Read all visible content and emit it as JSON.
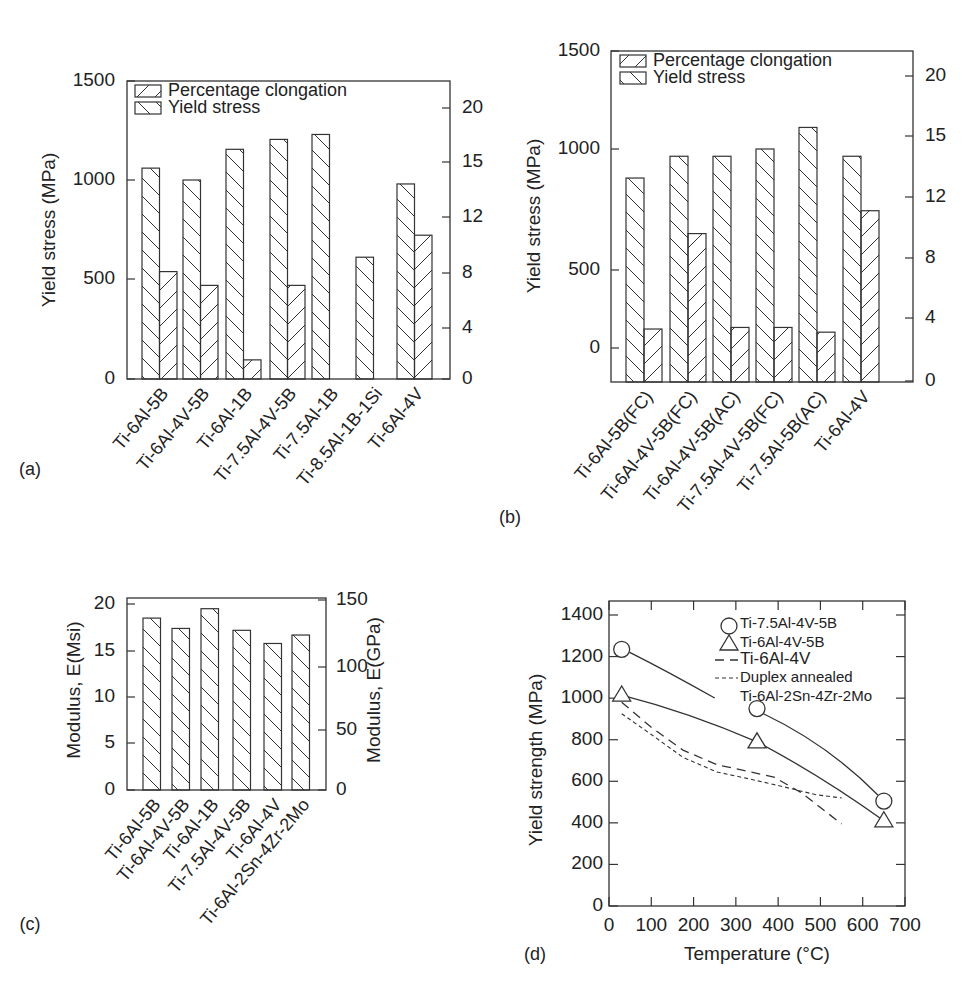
{
  "figure": {
    "panels": [
      "(a)",
      "(b)",
      "(c)",
      "(d)"
    ]
  },
  "chart_data": [
    {
      "id": "a",
      "panel_label": "(a)",
      "type": "bar",
      "title": "",
      "xlabel": "",
      "ylabel": "Yield stress (MPa)",
      "y2label": "",
      "ylim": [
        0,
        1500
      ],
      "yticks": [
        0,
        500,
        1000,
        1500
      ],
      "y2ticks": [
        "0",
        "4",
        "8",
        "12",
        "15",
        "20"
      ],
      "y2lim": [
        0,
        20
      ],
      "grid": false,
      "legend": [
        "Percentage clongation",
        "Yield stress"
      ],
      "legend_position": "upper left",
      "categories": [
        "Ti-6Al-5B",
        "Ti-6Al-4V-5B",
        "Ti-6Al-1B",
        "Ti-7.5Al-4V-5B",
        "Ti-7.5Al-1B",
        "Ti-8.5Al-1B-1Si",
        "Ti-6Al-4V"
      ],
      "series": [
        {
          "name": "Yield stress",
          "axis": "left",
          "pattern": "backslash",
          "values": [
            1060,
            1000,
            1155,
            1205,
            1230,
            610,
            980
          ]
        },
        {
          "name": "Percentage clongation",
          "axis": "right",
          "pattern": "slash",
          "values": [
            8.1,
            7.1,
            1.5,
            7.1,
            null,
            null,
            10.7
          ]
        }
      ]
    },
    {
      "id": "b",
      "panel_label": "(b)",
      "type": "bar",
      "title": "",
      "xlabel": "",
      "ylabel": "Yield stress (MPa)",
      "y2label": "",
      "ylim": [
        0,
        1500
      ],
      "yticks": [
        0,
        500,
        1000,
        1500
      ],
      "y2ticks": [
        "0",
        "4",
        "8",
        "12",
        "15",
        "20"
      ],
      "y2lim": [
        0,
        20
      ],
      "grid": false,
      "legend": [
        "Percentage clongation",
        "Yield stress"
      ],
      "legend_position": "upper left",
      "categories": [
        "Ti-6Al-5B(FC)",
        "Ti-6Al-4V-5B(FC)",
        "Ti-6Al-4V-5B(AC)",
        "Ti-7.5Al-4V-5B(FC)",
        "Ti-7.5Al-5B(AC)",
        "Ti-6Al-4V"
      ],
      "series": [
        {
          "name": "Yield stress",
          "axis": "left",
          "pattern": "backslash",
          "values": [
            880,
            970,
            970,
            1000,
            1110,
            970
          ]
        },
        {
          "name": "Percentage clongation",
          "axis": "right",
          "pattern": "slash",
          "values": [
            3.3,
            9.6,
            3.4,
            3.4,
            3.1,
            11.1
          ]
        }
      ]
    },
    {
      "id": "c",
      "panel_label": "(c)",
      "type": "bar",
      "title": "",
      "xlabel": "",
      "ylabel": "Modulus, E(Msi)",
      "y2label": "Modulus, E(GPa)",
      "ylim": [
        0,
        20
      ],
      "yticks": [
        0,
        5,
        10,
        15,
        20
      ],
      "y2ticks": [
        "0",
        "50",
        "100",
        "150"
      ],
      "y2lim": [
        0,
        150
      ],
      "grid": false,
      "legend": [],
      "categories": [
        "Ti-6Al-5B",
        "Ti-6Al-4V-5B",
        "Ti-6Al-1B",
        "Ti-7.5Al-4V-5B",
        "Ti-6Al-4V",
        "Ti-6Al-2Sn-4Zr-2Mo"
      ],
      "series": [
        {
          "name": "Modulus",
          "axis": "left",
          "pattern": "backslash",
          "values": [
            18.5,
            17.4,
            19.5,
            17.2,
            15.8,
            16.7
          ]
        }
      ]
    },
    {
      "id": "d",
      "panel_label": "(d)",
      "type": "line",
      "title": "",
      "xlabel": "Temperature (°C)",
      "ylabel": "Yield strength (MPa)",
      "xlim": [
        0,
        700
      ],
      "ylim": [
        0,
        1450
      ],
      "xticks": [
        0,
        100,
        200,
        300,
        400,
        500,
        600,
        700
      ],
      "yticks": [
        0,
        200,
        400,
        600,
        800,
        1000,
        1200,
        1400
      ],
      "grid": false,
      "legend": [
        "Ti-7.5Al-4V-5B",
        "Ti-6Al-4V-5B",
        "Ti-6Al-4V",
        "Duplex annealed",
        "Ti-6Al-2Sn-4Zr-2Mo"
      ],
      "legend_position": "upper right",
      "series": [
        {
          "name": "Ti-7.5Al-4V-5B",
          "style": "solid",
          "marker": "circle",
          "x": [
            30,
            350,
            650
          ],
          "y": [
            1235,
            950,
            505
          ]
        },
        {
          "name": "Ti-6Al-4V-5B",
          "style": "solid",
          "marker": "triangle",
          "x": [
            30,
            350,
            650
          ],
          "y": [
            1015,
            790,
            410
          ]
        },
        {
          "name": "Ti-6Al-4V",
          "style": "long-dash",
          "marker": "none",
          "x": [
            30,
            100,
            175,
            255,
            335,
            390,
            455,
            550
          ],
          "y": [
            980,
            860,
            750,
            680,
            645,
            620,
            545,
            395
          ]
        },
        {
          "name": "Duplex annealed Ti-6Al-2Sn-4Zr-2Mo",
          "style": "short-dash",
          "marker": "none",
          "x": [
            30,
            100,
            175,
            255,
            335,
            410,
            490,
            550
          ],
          "y": [
            925,
            825,
            715,
            645,
            610,
            575,
            535,
            520
          ]
        }
      ]
    }
  ]
}
